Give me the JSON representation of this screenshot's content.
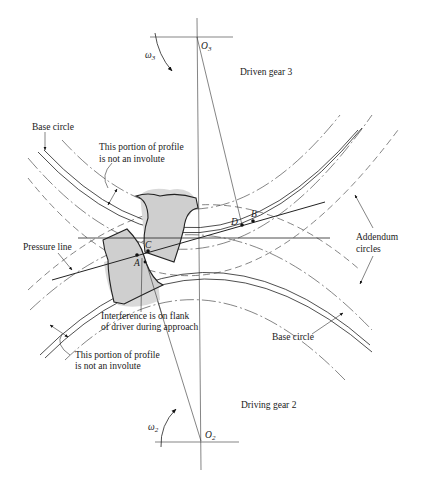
{
  "figure": {
    "type": "gear-interference-diagram",
    "labels": {
      "driven_gear": "Driven gear 3",
      "driving_gear": "Driving gear 2",
      "base_circle_top": "Base circle",
      "base_circle_bottom": "Base circle",
      "portion_top_line1": "This portion of profile",
      "portion_top_line2": "is not an involute",
      "portion_bottom_line1": "This portion of profile",
      "portion_bottom_line2": "is not an involute",
      "pressure_line": "Pressure line",
      "addendum_line1": "Addendum",
      "addendum_line2": "circles",
      "interference_line1": "Interference is on flank",
      "interference_line2": "of driver during approach"
    },
    "centers": {
      "o3": {
        "base": "O",
        "sub": "3"
      },
      "o2": {
        "base": "O",
        "sub": "2"
      }
    },
    "angular_velocity": {
      "w3": {
        "base": "ω",
        "sub": "3"
      },
      "w2": {
        "base": "ω",
        "sub": "2"
      }
    },
    "points": {
      "A": "A",
      "B": "B",
      "C": "C",
      "D": "D"
    },
    "colors": {
      "line": "#222222",
      "tooth_fill": "#cfcfcf",
      "background": "#ffffff"
    }
  }
}
